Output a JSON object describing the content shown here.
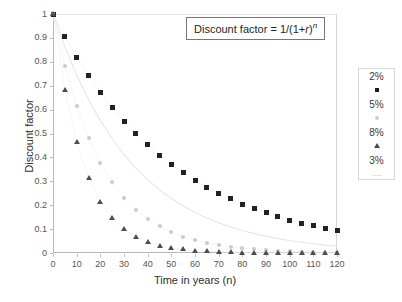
{
  "chart_data": {
    "type": "scatter",
    "title": "",
    "annotation": {
      "text": "Discount factor = 1/(1+r)n",
      "display_prefix": "Discount factor = 1/(1+",
      "display_var": "r",
      "display_close": ")",
      "display_exp": "n"
    },
    "xlabel": "Time in years (n)",
    "ylabel": "Discount factor",
    "xlim": [
      0,
      120
    ],
    "ylim": [
      0,
      1
    ],
    "xticks": [
      0,
      10,
      20,
      30,
      40,
      50,
      60,
      70,
      80,
      90,
      100,
      110,
      120
    ],
    "yticks": [
      0,
      0.1,
      0.2,
      0.3,
      0.4,
      0.5,
      0.6,
      0.7,
      0.8,
      0.9,
      1
    ],
    "ytick_labels": [
      "0",
      "0.1",
      "0.2",
      "0.3",
      "0.4",
      "0.5",
      "0.6",
      "0.7",
      "0.8",
      "0.9",
      "1"
    ],
    "xtick_labels": [
      "0",
      "10",
      "20",
      "30",
      "40",
      "50",
      "60",
      "70",
      "80",
      "90",
      "100",
      "110",
      "120"
    ],
    "grid": false,
    "legend_position": "right",
    "x": [
      0,
      5,
      10,
      15,
      20,
      25,
      30,
      35,
      40,
      45,
      50,
      55,
      60,
      65,
      70,
      75,
      80,
      85,
      90,
      95,
      100,
      105,
      110,
      115,
      120
    ],
    "series": [
      {
        "name": "2%",
        "rate": 0.02,
        "marker": "square",
        "color": "#222222",
        "values": [
          1.0,
          0.906,
          0.82,
          0.743,
          0.673,
          0.61,
          0.552,
          0.5,
          0.453,
          0.41,
          0.372,
          0.337,
          0.305,
          0.276,
          0.25,
          0.226,
          0.205,
          0.186,
          0.168,
          0.152,
          0.138,
          0.125,
          0.113,
          0.102,
          0.093
        ]
      },
      {
        "name": "5%",
        "rate": 0.05,
        "marker": "circle",
        "color": "#cbcbcb",
        "values": [
          1.0,
          0.784,
          0.614,
          0.481,
          0.377,
          0.295,
          0.231,
          0.181,
          0.142,
          0.111,
          0.087,
          0.068,
          0.054,
          0.042,
          0.033,
          0.026,
          0.02,
          0.016,
          0.012,
          0.01,
          0.008,
          0.006,
          0.005,
          0.004,
          0.003
        ]
      },
      {
        "name": "8%",
        "rate": 0.08,
        "marker": "triangle",
        "color": "#4d4d4d",
        "values": [
          1.0,
          0.681,
          0.463,
          0.315,
          0.215,
          0.146,
          0.099,
          0.068,
          0.046,
          0.031,
          0.021,
          0.015,
          0.01,
          0.007,
          0.005,
          0.003,
          0.002,
          0.0015,
          0.001,
          0.0007,
          0.0005,
          0.0003,
          0.0002,
          0.00015,
          0.0001
        ]
      },
      {
        "name": "3%",
        "rate": 0.03,
        "marker": "line",
        "color": "#e6e6e6",
        "values": [
          1.0,
          0.863,
          0.744,
          0.642,
          0.554,
          0.478,
          0.412,
          0.355,
          0.307,
          0.264,
          0.228,
          0.197,
          0.17,
          0.146,
          0.126,
          0.109,
          0.094,
          0.081,
          0.07,
          0.06,
          0.052,
          0.045,
          0.039,
          0.033,
          0.029
        ]
      }
    ],
    "legend_entries": [
      {
        "label": "2%",
        "marker": "square"
      },
      {
        "label": "5%",
        "marker": "circle"
      },
      {
        "label": "8%",
        "marker": "triangle"
      },
      {
        "label": "3%",
        "marker": "line"
      }
    ]
  }
}
